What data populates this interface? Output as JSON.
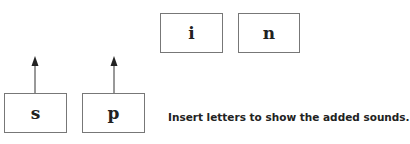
{
  "top_boxes": [
    {
      "letter": "i"
    },
    {
      "letter": "n"
    }
  ],
  "bottom_boxes": [
    {
      "letter": "s"
    },
    {
      "letter": "p"
    }
  ],
  "instruction": "Insert letters to show the added sounds."
}
